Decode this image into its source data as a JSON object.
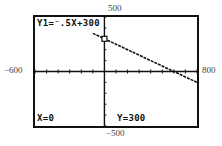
{
  "window_labels": {
    "ymax": "500",
    "xmin": "−600",
    "xmax": "800",
    "ymin": "−500"
  },
  "screen": {
    "equation": "Y1=⁻.5X+300",
    "trace_x": "X=0",
    "trace_y": "Y=300"
  },
  "chart_data": {
    "type": "line",
    "title": "",
    "equation": "Y1 = -0.5X + 300",
    "series": [
      {
        "name": "Y1",
        "x": [
          -100,
          800
        ],
        "y": [
          350,
          -100
        ]
      }
    ],
    "trace_point": {
      "x": 0,
      "y": 300
    },
    "xlim": [
      -600,
      800
    ],
    "ylim": [
      -500,
      500
    ],
    "xtick_step": 100,
    "ytick_step": 100,
    "grid": false,
    "xlabel": "",
    "ylabel": ""
  },
  "colors": {
    "ink": "#111111",
    "background": "#ffffff"
  }
}
